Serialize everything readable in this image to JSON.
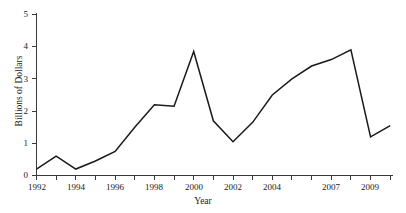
{
  "chart_data": {
    "type": "line",
    "title": "",
    "xlabel": "Year",
    "ylabel": "Billions of Dollars",
    "x": [
      1992,
      1993,
      1994,
      1995,
      1996,
      1997,
      1998,
      1999,
      2000,
      2001,
      2002,
      2003,
      2004,
      2005,
      2006,
      2007,
      2008,
      2009,
      2010
    ],
    "values": [
      0.2,
      0.6,
      0.2,
      0.45,
      0.75,
      1.5,
      2.2,
      2.15,
      3.85,
      1.7,
      1.05,
      1.65,
      2.5,
      3.0,
      3.4,
      3.6,
      3.9,
      1.2,
      1.55
    ],
    "series": [
      {
        "name": "Dollars",
        "values": [
          0.2,
          0.6,
          0.2,
          0.45,
          0.75,
          1.5,
          2.2,
          2.15,
          3.85,
          1.7,
          1.05,
          1.65,
          2.5,
          3.0,
          3.4,
          3.6,
          3.9,
          1.2,
          1.55
        ]
      }
    ],
    "xlim": [
      1992,
      2011
    ],
    "ylim": [
      0,
      5
    ],
    "ytick_values": [
      0,
      1,
      2,
      3,
      4,
      5
    ],
    "ytick_labels": [
      "0",
      "1",
      "2",
      "3",
      "4",
      "5"
    ],
    "xtick_values": [
      1992,
      1994,
      1996,
      1998,
      2000,
      2002,
      2004,
      2007,
      2009
    ],
    "xtick_labels": [
      "1992",
      "1994",
      "1996",
      "1998",
      "2000",
      "2002",
      "2004",
      "2007",
      "2009"
    ],
    "grid": false,
    "legend": "none",
    "line_color": "#1a1a1a",
    "axis_color": "#3a3a3a"
  },
  "axes": {
    "x_title": "Year",
    "y_title": "Billions of Dollars"
  },
  "ylabels": {
    "t0": "0",
    "t1": "1",
    "t2": "2",
    "t3": "3",
    "t4": "4",
    "t5": "5"
  },
  "xlabels": {
    "t0": "1992",
    "t1": "1994",
    "t2": "1996",
    "t3": "1998",
    "t4": "2000",
    "t5": "2002",
    "t6": "2004",
    "t7": "2007",
    "t8": "2009"
  }
}
